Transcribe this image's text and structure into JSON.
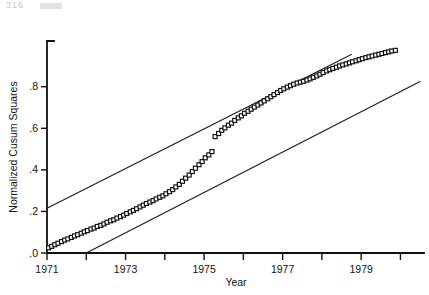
{
  "page": {
    "header_artifact": "316"
  },
  "chart_data": {
    "type": "scatter",
    "title": "",
    "xlabel": "Year",
    "ylabel": "Normalized Cusum Squares",
    "xlim": [
      1971,
      1980.6
    ],
    "ylim": [
      0.0,
      1.02
    ],
    "grid": false,
    "legend": null,
    "marker_style": "open-square",
    "x_ticks_major": [
      1971,
      1973,
      1975,
      1977,
      1979
    ],
    "x_tick_labels": [
      "1971",
      "1973",
      "1975",
      "1977",
      "1979"
    ],
    "x_ticks_minor": [
      1972,
      1974,
      1976,
      1978,
      1980
    ],
    "y_ticks": [
      0.0,
      0.2,
      0.4,
      0.6,
      0.8
    ],
    "y_tick_labels": [
      ".0",
      ".2",
      ".4",
      ".6",
      ".8"
    ],
    "series": [
      {
        "name": "Normalized Cusum Squares",
        "type": "scatter",
        "x": [
          1971.04,
          1971.12,
          1971.2,
          1971.28,
          1971.37,
          1971.45,
          1971.53,
          1971.62,
          1971.7,
          1971.78,
          1971.87,
          1971.95,
          1972.03,
          1972.12,
          1972.2,
          1972.28,
          1972.37,
          1972.45,
          1972.53,
          1972.62,
          1972.7,
          1972.78,
          1972.87,
          1972.95,
          1973.03,
          1973.12,
          1973.2,
          1973.28,
          1973.37,
          1973.45,
          1973.53,
          1973.62,
          1973.7,
          1973.78,
          1973.87,
          1973.95,
          1974.03,
          1974.12,
          1974.2,
          1974.28,
          1974.37,
          1974.45,
          1974.53,
          1974.62,
          1974.7,
          1974.78,
          1974.87,
          1974.95,
          1975.03,
          1975.12,
          1975.2,
          1975.28,
          1975.37,
          1975.45,
          1975.53,
          1975.62,
          1975.7,
          1975.78,
          1975.87,
          1975.95,
          1976.03,
          1976.12,
          1976.2,
          1976.28,
          1976.37,
          1976.45,
          1976.53,
          1976.62,
          1976.7,
          1976.78,
          1976.87,
          1976.95,
          1977.03,
          1977.12,
          1977.2,
          1977.28,
          1977.37,
          1977.45,
          1977.53,
          1977.62,
          1977.7,
          1977.78,
          1977.87,
          1977.95,
          1978.03,
          1978.12,
          1978.2,
          1978.28,
          1978.37,
          1978.45,
          1978.53,
          1978.62,
          1978.7,
          1978.78,
          1978.87,
          1978.95,
          1979.03,
          1979.12,
          1979.2,
          1979.28,
          1979.37,
          1979.45,
          1979.53,
          1979.62,
          1979.7,
          1979.78,
          1979.87
        ],
        "y": [
          0.025,
          0.032,
          0.04,
          0.047,
          0.055,
          0.062,
          0.068,
          0.075,
          0.082,
          0.088,
          0.095,
          0.102,
          0.108,
          0.115,
          0.12,
          0.128,
          0.133,
          0.14,
          0.148,
          0.155,
          0.16,
          0.168,
          0.175,
          0.182,
          0.19,
          0.198,
          0.205,
          0.213,
          0.222,
          0.23,
          0.238,
          0.245,
          0.252,
          0.26,
          0.268,
          0.275,
          0.285,
          0.295,
          0.305,
          0.318,
          0.33,
          0.345,
          0.36,
          0.375,
          0.392,
          0.408,
          0.425,
          0.44,
          0.458,
          0.472,
          0.488,
          0.56,
          0.575,
          0.59,
          0.602,
          0.615,
          0.625,
          0.638,
          0.65,
          0.66,
          0.672,
          0.682,
          0.692,
          0.702,
          0.712,
          0.722,
          0.732,
          0.742,
          0.752,
          0.762,
          0.772,
          0.782,
          0.79,
          0.798,
          0.805,
          0.812,
          0.818,
          0.822,
          0.826,
          0.832,
          0.838,
          0.845,
          0.852,
          0.86,
          0.868,
          0.876,
          0.882,
          0.888,
          0.894,
          0.9,
          0.905,
          0.91,
          0.915,
          0.92,
          0.925,
          0.93,
          0.935,
          0.94,
          0.944,
          0.948,
          0.952,
          0.956,
          0.96,
          0.964,
          0.968,
          0.972,
          0.975
        ]
      },
      {
        "name": "Upper significance bound",
        "type": "line",
        "x": [
          1971.0,
          1978.75
        ],
        "y": [
          0.215,
          0.955
        ]
      },
      {
        "name": "Lower significance bound",
        "type": "line",
        "x": [
          1972.0,
          1980.5
        ],
        "y": [
          0.0,
          0.825
        ]
      }
    ]
  }
}
